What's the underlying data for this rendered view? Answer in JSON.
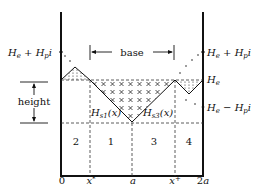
{
  "diagram": {
    "left_labels": {
      "top": "H_e + H_p i",
      "height": "height"
    },
    "right_labels": {
      "top": "H_e + H_p i",
      "middle": "H_e",
      "bottom": "H_e − H_p i"
    },
    "base_label": "base",
    "curve_labels": {
      "left": "H_s1(x)",
      "right": "H_s3(x)"
    },
    "regions": [
      "2",
      "1",
      "3",
      "4"
    ],
    "x_axis_ticks": [
      "0",
      "x*",
      "a",
      "x+",
      "2a"
    ],
    "colors": {
      "ink": "#111111",
      "background": "#ffffff"
    }
  }
}
